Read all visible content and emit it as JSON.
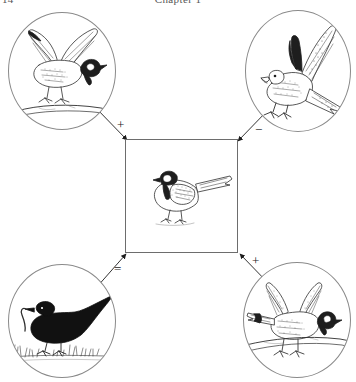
{
  "header": {
    "folio": "14",
    "chapter_title": "Chapter 1"
  },
  "figure": {
    "center": {
      "name": "great-tit-focal-individual",
      "caption": ""
    },
    "vignettes": [
      {
        "id": "top-left",
        "name": "great-tit-landing-on-branch",
        "sign": "+",
        "sign_name": "plus-sign"
      },
      {
        "id": "top-right",
        "name": "sparrowhawk-predator",
        "sign": "−",
        "sign_name": "minus-sign"
      },
      {
        "id": "bottom-left",
        "name": "blackbird-with-worm",
        "sign": "=",
        "sign_name": "equals-sign"
      },
      {
        "id": "bottom-right",
        "name": "great-tit-wings-spread-on-branch",
        "sign": "+",
        "sign_name": "plus-sign"
      }
    ],
    "arrows": [
      {
        "name": "arrow-from-top-left-to-center",
        "direction": "down-right"
      },
      {
        "name": "arrow-from-top-right-to-center",
        "direction": "down-left"
      },
      {
        "name": "arrow-from-bottom-left-to-center",
        "direction": "up-right"
      },
      {
        "name": "arrow-from-bottom-right-to-center",
        "direction": "up-left"
      }
    ]
  },
  "colors": {
    "ink": "#2b2b2b",
    "line": "#6d6d6d",
    "circle_stroke": "#8a8a8a",
    "background": "#ffffff"
  }
}
